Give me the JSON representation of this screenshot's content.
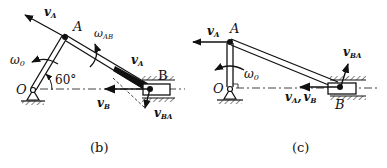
{
  "figure_b": {
    "caption": "(b)",
    "labels": {
      "vA_top": "v",
      "vA_top_sub": "A",
      "A": "A",
      "omega_AB": "ω",
      "omega_AB_sub": "AB",
      "vA_link": "v",
      "vA_link_sub": "A",
      "B": "B",
      "omega0": "ω",
      "omega0_sub": "0",
      "angle": "60°",
      "O": "O",
      "vB": "v",
      "vB_sub": "B",
      "vBA": "v",
      "vBA_sub": "BA"
    }
  },
  "figure_c": {
    "caption": "(c)",
    "labels": {
      "vA_top": "v",
      "vA_top_sub": "A",
      "A": "A",
      "vBA": "v",
      "vBA_sub": "BA",
      "omega0": "ω",
      "omega0_sub": "0",
      "O": "O",
      "vA_bottom": "v",
      "vA_bottom_sub": "A",
      "comma": ",",
      "vB": "v",
      "vB_sub": "B",
      "B": "B"
    }
  },
  "colors": {
    "ink": "#111111",
    "background": "#ffffff"
  }
}
